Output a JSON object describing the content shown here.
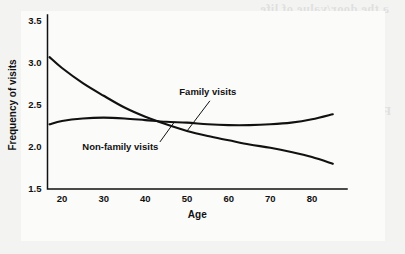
{
  "chart_data": {
    "type": "line",
    "title": "",
    "xlabel": "Age",
    "ylabel": "Frequency of visits",
    "xlim": [
      16,
      86
    ],
    "ylim": [
      1.5,
      3.5
    ],
    "xticks": [
      20,
      30,
      40,
      50,
      60,
      70,
      80
    ],
    "yticks": [
      "1.5",
      "2.0",
      "2.5",
      "3.0",
      "3.5"
    ],
    "grid": false,
    "legend_position": "inline-annotations",
    "line_color": "#111111",
    "background_color": "#fbfbfa",
    "series": [
      {
        "name": "Family visits",
        "label_x": 55,
        "label_y": 2.62,
        "x": [
          17,
          20,
          25,
          30,
          35,
          40,
          45,
          50,
          55,
          60,
          65,
          70,
          75,
          80,
          85
        ],
        "values": [
          3.07,
          2.94,
          2.76,
          2.61,
          2.47,
          2.36,
          2.27,
          2.19,
          2.13,
          2.08,
          2.03,
          1.99,
          1.94,
          1.88,
          1.8
        ]
      },
      {
        "name": "Non-family visits",
        "label_x": 34,
        "label_y": 1.97,
        "x": [
          17,
          20,
          25,
          30,
          35,
          40,
          45,
          50,
          55,
          60,
          65,
          70,
          75,
          80,
          85
        ],
        "values": [
          2.27,
          2.31,
          2.34,
          2.35,
          2.34,
          2.32,
          2.3,
          2.29,
          2.27,
          2.26,
          2.26,
          2.27,
          2.29,
          2.33,
          2.39
        ]
      }
    ],
    "annotations": [
      {
        "text": "Family visits",
        "leader_from_x": 50,
        "leader_from_y": 2.19,
        "leader_to_x": 55.5,
        "leader_to_y": 2.55
      },
      {
        "text": "Non-family visits",
        "leader_from_x": 47,
        "leader_from_y": 2.3,
        "leader_to_x": 43.5,
        "leader_to_y": 2.06
      }
    ]
  },
  "page_bleed": {
    "lines": [
      "a the door/value of life",
      "the anti social problem",
      "be the optimum and the bias",
      "thing to a humanitarian mode",
      "FURTHER READING",
      "the considered social problem",
      "that as the social being is for",
      "taking the measure of life",
      "are considered in the conflict",
      "a part of social communication"
    ]
  }
}
